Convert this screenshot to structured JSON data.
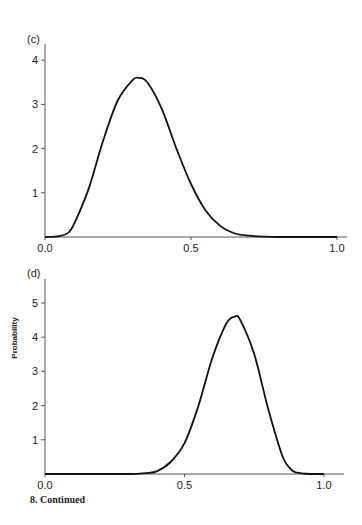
{
  "figure": {
    "caption": "8.  Continued",
    "ylabel": "Probability"
  },
  "chart_data": [
    {
      "type": "line",
      "panel_label": "(c)",
      "title": "",
      "xlabel": "",
      "ylabel": "",
      "xlim": [
        0.0,
        1.0
      ],
      "ylim": [
        0,
        4.3
      ],
      "x_ticks": [
        "0.0",
        "0.5",
        "1.0"
      ],
      "y_ticks": [
        "1",
        "2",
        "3",
        "4"
      ],
      "grid": false,
      "x": [
        0.0,
        0.05,
        0.08,
        0.1,
        0.15,
        0.2,
        0.25,
        0.3,
        0.32,
        0.35,
        0.4,
        0.45,
        0.5,
        0.55,
        0.6,
        0.65,
        0.7,
        0.75,
        0.8,
        0.9,
        1.0
      ],
      "values": [
        0.0,
        0.02,
        0.1,
        0.3,
        1.1,
        2.2,
        3.1,
        3.55,
        3.6,
        3.5,
        2.9,
        2.0,
        1.2,
        0.6,
        0.25,
        0.08,
        0.03,
        0.01,
        0.0,
        0.0,
        0.0
      ]
    },
    {
      "type": "line",
      "panel_label": "(d)",
      "title": "",
      "xlabel": "",
      "ylabel": "Probability",
      "xlim": [
        0.0,
        1.0
      ],
      "ylim": [
        0,
        5.8
      ],
      "x_ticks": [
        "0.0",
        "0.5",
        "1.0"
      ],
      "y_ticks": [
        "1",
        "2",
        "3",
        "4",
        "5"
      ],
      "grid": false,
      "x": [
        0.0,
        0.2,
        0.3,
        0.35,
        0.4,
        0.45,
        0.5,
        0.55,
        0.6,
        0.65,
        0.68,
        0.7,
        0.75,
        0.8,
        0.85,
        0.88,
        0.9,
        0.95,
        1.0
      ],
      "values": [
        0.0,
        0.0,
        0.0,
        0.02,
        0.08,
        0.35,
        0.9,
        2.0,
        3.4,
        4.4,
        4.6,
        4.5,
        3.5,
        1.9,
        0.55,
        0.15,
        0.05,
        0.0,
        0.0
      ]
    }
  ]
}
